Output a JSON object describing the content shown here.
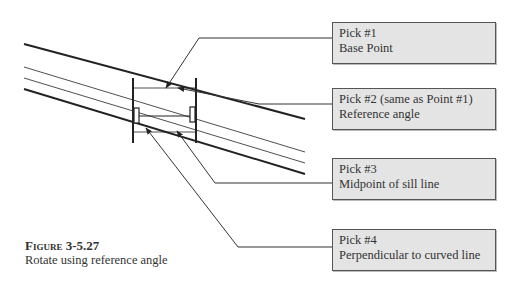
{
  "callouts": [
    {
      "line1": "Pick #1",
      "line2": "Base Point"
    },
    {
      "line1": "Pick #2 (same as Point #1)",
      "line2": "Reference angle"
    },
    {
      "line1": "Pick #3",
      "line2": "Midpoint of sill line"
    },
    {
      "line1": "Pick #4",
      "line2": "Perpendicular to curved line"
    }
  ],
  "caption": {
    "figure": "Figure 3-5.27",
    "text": "Rotate using reference angle"
  }
}
